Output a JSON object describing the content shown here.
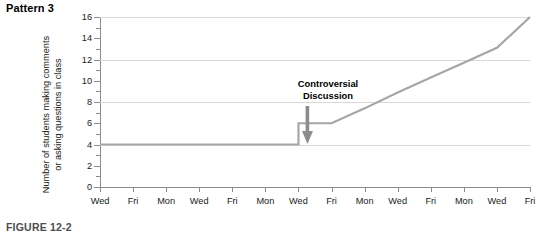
{
  "pattern_title": "Pattern 3",
  "figure_caption": "FIGURE 12-2",
  "annotation": {
    "line1": "Controversial",
    "line2": "Discussion",
    "arrow_icon": "down-arrow-icon"
  },
  "colors": {
    "line": "#a6a6a6",
    "grid": "#d8d8d8",
    "axis": "#8c8c8c",
    "text": "#1a1a1a",
    "caption": "#4d4d4d",
    "arrow": "#8c8c8c"
  },
  "y_axis": {
    "title_line1": "Number of students making comments",
    "title_line2": "or asking questions in class",
    "ticks": [
      0,
      2,
      4,
      6,
      8,
      10,
      12,
      14,
      16
    ],
    "gridline_values": [
      4,
      8,
      12,
      16
    ],
    "min": 0,
    "max": 16
  },
  "x_axis": {
    "labels": [
      "Wed",
      "Fri",
      "Mon",
      "Wed",
      "Fri",
      "Mon",
      "Wed",
      "Fri",
      "Mon",
      "Wed",
      "Fri",
      "Mon",
      "Wed",
      "Fri"
    ]
  },
  "chart_data": {
    "type": "line",
    "title": "Pattern 3",
    "subtitle": "",
    "xlabel": "",
    "ylabel": "Number of students making comments or asking questions in class",
    "x": [
      "Wed",
      "Fri",
      "Mon",
      "Wed",
      "Fri",
      "Mon",
      "Wed",
      "Fri",
      "Mon",
      "Wed",
      "Fri",
      "Mon",
      "Wed",
      "Fri"
    ],
    "series": [
      {
        "name": "Number of students making comments or asking questions in class",
        "values": [
          4,
          4,
          4,
          4,
          4,
          4,
          4,
          6,
          7.4,
          8.9,
          10.3,
          11.7,
          13.1,
          16
        ],
        "color": "#a6a6a6"
      }
    ],
    "ylim": [
      0,
      16
    ],
    "ytick_step": 2,
    "gridlines": [
      4,
      8,
      12,
      16
    ],
    "grid": true,
    "legend": "none",
    "annotations": [
      {
        "text": "Controversial Discussion",
        "x": "Wed",
        "x_index": 6,
        "points_to_y": 4,
        "style": "down-arrow"
      }
    ]
  }
}
